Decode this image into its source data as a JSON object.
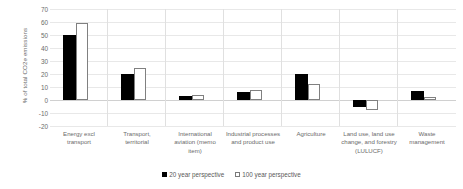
{
  "chart_data": {
    "type": "bar",
    "title": "",
    "subtitle": "",
    "xlabel": "",
    "ylabel": "% of total CO2e emissions",
    "ylim": [
      -20,
      70
    ],
    "ytick_step": 10,
    "yticks": [
      "70",
      "60",
      "50",
      "40",
      "30",
      "20",
      "10",
      "0",
      "-10",
      "-20"
    ],
    "grid": true,
    "legend_position": "bottom",
    "categories": [
      "Energy excl transport",
      "Transport, territorial",
      "International aviation (memo item)",
      "Industrial processes and product use",
      "Agriculture",
      "Land use, land use change, and forestry (LULUCF)",
      "Waste management"
    ],
    "category_labels": [
      "Energy excl\ntransport",
      "Transport,\nterritorial",
      "International\naviation (memo\nitem)",
      "Industrial processes\nand product use",
      "Agriculture",
      "Land use, land use\nchange, and forestry\n(LULUCF)",
      "Waste\nmanagement"
    ],
    "series": [
      {
        "name": "20 year perspective",
        "color": "#000000",
        "style": "filled",
        "values": [
          50,
          20,
          3,
          6.5,
          20,
          -5,
          7
        ]
      },
      {
        "name": "100 year perspective",
        "color": "#ffffff",
        "style": "hollow",
        "values": [
          59,
          25,
          4,
          8,
          12,
          -8,
          2
        ]
      }
    ]
  },
  "legend": {
    "items": [
      {
        "label": "20 year perspective",
        "swatch": "filled"
      },
      {
        "label": "100 year perspective",
        "swatch": "hollow"
      }
    ]
  }
}
